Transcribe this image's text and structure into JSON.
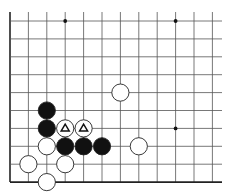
{
  "diagram": {
    "type": "go-board-corner",
    "grid": {
      "origin_x": 10,
      "origin_y": 21,
      "spacing_x": 18.4,
      "spacing_y": 17.9,
      "columns": 12,
      "rows": 10,
      "right_extent": 222,
      "top_extent": 12,
      "line_color": "#555555",
      "edge_color": "#222222"
    },
    "star_points": [
      {
        "col": 3,
        "row": 0
      },
      {
        "col": 9,
        "row": 0
      },
      {
        "col": 9,
        "row": 6
      }
    ],
    "stones": [
      {
        "color": "white",
        "col": 6,
        "row": 4,
        "mark": ""
      },
      {
        "color": "black",
        "col": 2,
        "row": 5,
        "mark": ""
      },
      {
        "color": "black",
        "col": 2,
        "row": 6,
        "mark": ""
      },
      {
        "color": "white",
        "col": 3,
        "row": 6,
        "mark": "triangle"
      },
      {
        "color": "white",
        "col": 4,
        "row": 6,
        "mark": "triangle"
      },
      {
        "color": "white",
        "col": 2,
        "row": 7,
        "mark": ""
      },
      {
        "color": "black",
        "col": 3,
        "row": 7,
        "mark": ""
      },
      {
        "color": "black",
        "col": 4,
        "row": 7,
        "mark": ""
      },
      {
        "color": "black",
        "col": 5,
        "row": 7,
        "mark": ""
      },
      {
        "color": "white",
        "col": 7,
        "row": 7,
        "mark": ""
      },
      {
        "color": "white",
        "col": 1,
        "row": 8,
        "mark": ""
      },
      {
        "color": "white",
        "col": 3,
        "row": 8,
        "mark": ""
      },
      {
        "color": "white",
        "col": 2,
        "row": 9,
        "mark": ""
      }
    ],
    "colors": {
      "black_stone": "#111111",
      "white_stone": "#ffffff",
      "stone_outline": "#222222",
      "background": "#ffffff"
    }
  }
}
